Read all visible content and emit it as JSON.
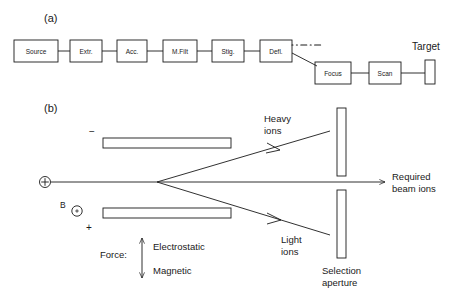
{
  "figure": {
    "panel_a": {
      "label": "(a)",
      "boxes": [
        {
          "name": "source",
          "label": "Source",
          "x": 14,
          "y": 40,
          "w": 44,
          "h": 22
        },
        {
          "name": "extr",
          "label": "Extr.",
          "x": 70,
          "y": 40,
          "w": 32,
          "h": 22
        },
        {
          "name": "acc",
          "label": "Acc.",
          "x": 117,
          "y": 40,
          "w": 30,
          "h": 22
        },
        {
          "name": "mfilt",
          "label": "M.Filt",
          "x": 163,
          "y": 40,
          "w": 34,
          "h": 22
        },
        {
          "name": "stig",
          "label": "Stig.",
          "x": 212,
          "y": 40,
          "w": 32,
          "h": 22
        },
        {
          "name": "defl",
          "label": "Defl.",
          "x": 260,
          "y": 40,
          "w": 32,
          "h": 22
        },
        {
          "name": "focus",
          "label": "Focus",
          "x": 315,
          "y": 62,
          "w": 36,
          "h": 22
        },
        {
          "name": "scan",
          "label": "Scan",
          "x": 369,
          "y": 62,
          "w": 32,
          "h": 22
        }
      ],
      "target": {
        "label": "Target",
        "x": 425,
        "y": 60,
        "w": 10,
        "h": 24
      }
    },
    "panel_b": {
      "label": "(b)",
      "source_marker": "+",
      "field_symbol_label": "B",
      "top_plate_sign": "−",
      "bottom_plate_sign": "+",
      "labels": {
        "heavy_ions_line1": "Heavy",
        "heavy_ions_line2": "ions",
        "light_ions_line1": "Light",
        "light_ions_line2": "ions",
        "required_line1": "Required",
        "required_line2": "beam ions",
        "aperture_line1": "Selection",
        "aperture_line2": "aperture",
        "force": "Force:",
        "electrostatic": "Electrostatic",
        "magnetic": "Magnetic"
      }
    }
  },
  "colors": {
    "ink": "#1a1a1a",
    "background": "#ffffff"
  }
}
